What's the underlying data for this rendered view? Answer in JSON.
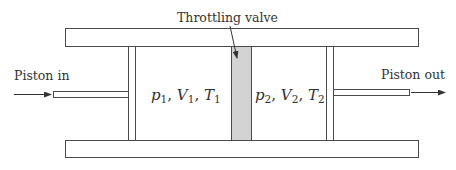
{
  "diagram": {
    "labels": {
      "throttling_valve": "Throttling valve",
      "piston_in": "Piston in",
      "piston_out": "Piston out"
    },
    "state1": {
      "p": "p",
      "p_sub": "1",
      "V": "V",
      "V_sub": "1",
      "T": "T",
      "T_sub": "1",
      "sep": ","
    },
    "state2": {
      "p": "p",
      "p_sub": "2",
      "V": "V",
      "V_sub": "2",
      "T": "T",
      "T_sub": "2",
      "sep": ","
    },
    "colors": {
      "stroke": "#4a4a4a",
      "valve_fill": "#d3d3d3",
      "background": "#ffffff",
      "text": "#333333"
    },
    "components": [
      "top-cylinder-wall",
      "bottom-cylinder-wall",
      "left-piston",
      "left-piston-rod",
      "throttling-valve",
      "right-piston",
      "right-piston-rod"
    ]
  }
}
